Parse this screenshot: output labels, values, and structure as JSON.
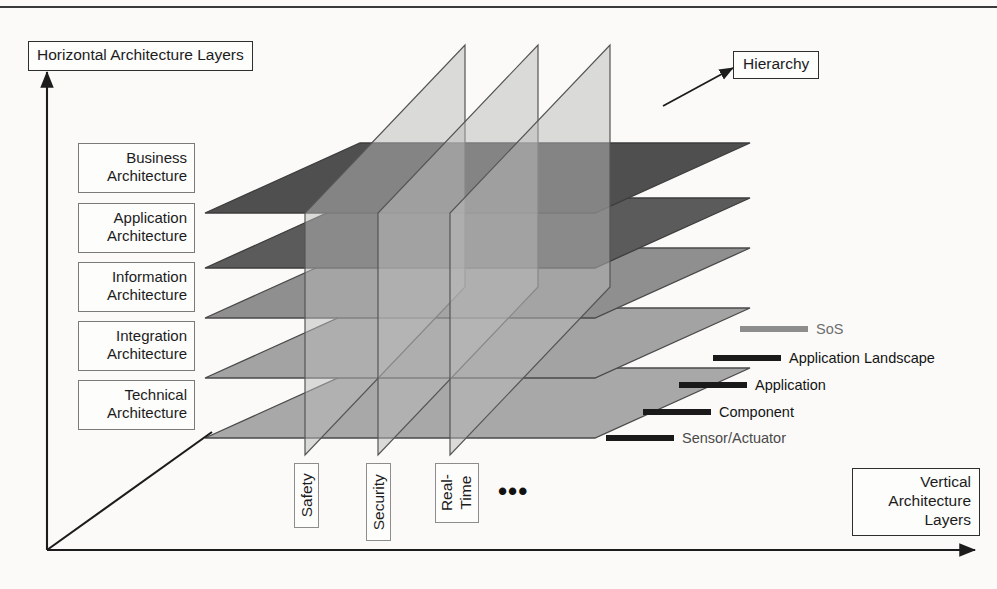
{
  "diagram": {
    "title_horizontal_axis": "Horizontal Architecture Layers",
    "title_vertical_axis": "Vertical\nArchitecture\nLayers",
    "title_depth_axis": "Hierarchy",
    "horizontal_layers": [
      {
        "label": "Business\nArchitecture",
        "plane_color": "#4f4f4f"
      },
      {
        "label": "Application\nArchitecture",
        "plane_color": "#5b5b5b"
      },
      {
        "label": "Information\nArchitecture",
        "plane_color": "#8f8f8f"
      },
      {
        "label": "Integration\nArchitecture",
        "plane_color": "#a3a3a3"
      },
      {
        "label": "Technical\nArchitecture",
        "plane_color": "#a8a8a8"
      }
    ],
    "vertical_layers": [
      {
        "label": "Safety"
      },
      {
        "label": "Security"
      },
      {
        "label": "Real-\nTime"
      }
    ],
    "vertical_layers_more": "•••",
    "hierarchy_levels": [
      {
        "label": "SoS",
        "bar_color": "#8d8d8d",
        "text_color": "#6e6e6e"
      },
      {
        "label": "Application Landscape",
        "bar_color": "#1a1a1a",
        "text_color": "#141414"
      },
      {
        "label": "Application",
        "bar_color": "#1a1a1a",
        "text_color": "#141414"
      },
      {
        "label": "Component",
        "bar_color": "#1a1a1a",
        "text_color": "#141414"
      },
      {
        "label": "Sensor/Actuator",
        "bar_color": "#1a1a1a",
        "text_color": "#4a4a4a"
      }
    ],
    "colors": {
      "axis": "#1c1c1c",
      "vertical_plane_fill": "#b9b9b9",
      "vertical_plane_stroke": "#555555",
      "plane_stroke": "#4a4a4a",
      "background": "#fbfaf8"
    }
  }
}
